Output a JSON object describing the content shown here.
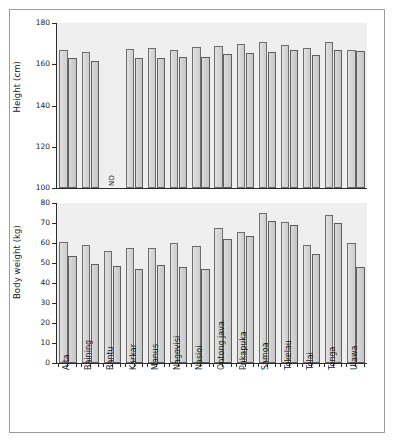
{
  "figure": {
    "background": "#ffffff",
    "frame_color": "#9b9b9b",
    "plot_background": "#efefef",
    "bar_fill": "#d7d7d7",
    "bar_edge": "#6d6d6d"
  },
  "chart_data": [
    {
      "id": "height-chart",
      "type": "bar",
      "title": "",
      "xlabel": "",
      "ylabel": "Height (cm)",
      "ylim": [
        100,
        180
      ],
      "yticks": [
        100,
        120,
        140,
        160,
        180
      ],
      "ytick_labels": [
        "100",
        "120",
        "140",
        "160",
        "180"
      ],
      "grid": false,
      "legend": "none",
      "categories": [
        "Aita",
        "Baining",
        "Bantu",
        "Karkar",
        "Manus",
        "Nagovisi",
        "Nasioi",
        "Ontong java",
        "Pukapuka",
        "Samoa",
        "Tokelau",
        "Tolai",
        "Tonga",
        "Ulawa"
      ],
      "series": [
        {
          "name": "Male",
          "values": [
            167.0,
            166.0,
            null,
            167.5,
            168.0,
            166.8,
            168.6,
            169.0,
            170.0,
            171.0,
            169.5,
            168.0,
            171.0,
            167.0
          ]
        },
        {
          "name": "Female",
          "values": [
            163.0,
            161.5,
            null,
            163.2,
            163.2,
            163.4,
            163.4,
            164.8,
            165.4,
            165.9,
            166.8,
            164.6,
            166.7,
            166.3
          ]
        }
      ],
      "annotations": [
        {
          "category": "Bantu",
          "text": "ND",
          "meaning": "no data"
        }
      ]
    },
    {
      "id": "body-weight-chart",
      "type": "bar",
      "title": "",
      "xlabel": "",
      "ylabel": "Body weight (kg)",
      "ylim": [
        0,
        80
      ],
      "yticks": [
        0,
        10,
        20,
        30,
        40,
        50,
        60,
        70,
        80
      ],
      "ytick_labels": [
        "0",
        "10",
        "20",
        "30",
        "40",
        "50",
        "60",
        "70",
        "80"
      ],
      "grid": false,
      "legend": "none",
      "categories": [
        "Aita",
        "Baining",
        "Bantu",
        "Karkar",
        "Manus",
        "Nagovisi",
        "Nasioi",
        "Ontong java",
        "Pukapuka",
        "Samoa",
        "Tokelau",
        "Tolai",
        "Tonga",
        "Ulawa"
      ],
      "series": [
        {
          "name": "Male",
          "values": [
            60.5,
            59.0,
            56.0,
            57.5,
            57.5,
            60.0,
            58.5,
            67.5,
            65.5,
            75.0,
            70.5,
            59.0,
            74.0,
            60.0
          ]
        },
        {
          "name": "Female",
          "values": [
            53.5,
            49.5,
            48.5,
            47.0,
            49.0,
            48.0,
            47.0,
            62.0,
            63.5,
            71.0,
            69.0,
            54.5,
            70.0,
            48.0
          ]
        }
      ],
      "annotations": []
    }
  ]
}
